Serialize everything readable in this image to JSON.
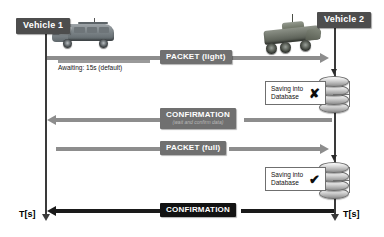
{
  "diagram": {
    "nodes": [
      {
        "id": "vehicle-1",
        "label": "Vehicle 1",
        "icon": "van-vehicle-icon"
      },
      {
        "id": "vehicle-2",
        "label": "Vehicle 2",
        "icon": "armoured-vehicle-icon"
      }
    ],
    "time_axis": {
      "left_label": "T[s]",
      "right_label": "T[s]"
    },
    "annotations": {
      "awaiting": {
        "prefix": "Awaiting: 15s",
        "suffix": "(default)",
        "full": "Awaiting: 15s (default)"
      }
    },
    "messages": [
      {
        "id": "packet-light",
        "label": "PACKET (light)",
        "sublabel": "",
        "direction": "right",
        "style": "grey"
      },
      {
        "id": "confirmation-partial",
        "label": "CONFIRMATION",
        "sublabel": "(wait and confirm data)",
        "direction": "left",
        "style": "grey"
      },
      {
        "id": "packet-full",
        "label": "PACKET (full)",
        "sublabel": "",
        "direction": "right",
        "style": "grey"
      },
      {
        "id": "confirmation-final",
        "label": "CONFIRMATION",
        "sublabel": "",
        "direction": "left",
        "style": "dark"
      }
    ],
    "database_steps": [
      {
        "id": "saving-failed",
        "line1": "Saving into",
        "line2": "Database",
        "mark": "✘",
        "mark_name": "cross-mark-icon",
        "status": "failed"
      },
      {
        "id": "saving-succeeded",
        "line1": "Saving into",
        "line2": "Database",
        "mark": "✔",
        "mark_name": "check-mark-icon",
        "status": "succeeded"
      }
    ],
    "colors": {
      "node_label_bg": "#4d4d4d",
      "message_grey": "#707070",
      "message_dark": "#121212",
      "arrow_grey": "#8d8d8d",
      "arrow_dark": "#1a1a1a",
      "lifeline": "#3a3a3a",
      "background": "#ffffff"
    }
  }
}
